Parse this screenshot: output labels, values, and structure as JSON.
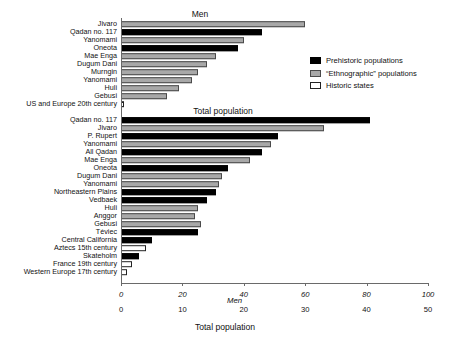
{
  "figure": {
    "width": 450,
    "height": 346,
    "axis_bottom_label": "Total population",
    "axis_men_label": "Men"
  },
  "legend": {
    "items": [
      {
        "key": "prehistoric",
        "label": "Prehistoric populations",
        "color": "#000000"
      },
      {
        "key": "ethnographic",
        "label": "“Ethnographic” populations",
        "color": "#a8a8a8"
      },
      {
        "key": "historic",
        "label": "Historic states",
        "color": "#ffffff"
      }
    ]
  },
  "chart_data": {
    "type": "bar",
    "orientation": "horizontal",
    "title": "",
    "panels": [
      {
        "name": "men",
        "title": "Men",
        "xlabel": "Men",
        "ylabel": "",
        "xlim": [
          0,
          100
        ],
        "xticks": [
          0,
          20,
          40,
          60,
          80,
          100
        ],
        "grid": false,
        "categories": [
          "Jivaro",
          "Qadan no. 117",
          "Yanomami",
          "Oneota",
          "Mae Enga",
          "Dugum Dani",
          "Murngin",
          "Yanomami",
          "Huli",
          "Gebusi",
          "US and Europe 20th century"
        ],
        "values": [
          60,
          46,
          40,
          38,
          31,
          28,
          25,
          23,
          19,
          15,
          1
        ],
        "groups": [
          "ethnographic",
          "prehistoric",
          "ethnographic",
          "prehistoric",
          "ethnographic",
          "ethnographic",
          "ethnographic",
          "ethnographic",
          "ethnographic",
          "ethnographic",
          "historic"
        ]
      },
      {
        "name": "total_population",
        "title": "Total population",
        "xlabel": "Total population",
        "ylabel": "",
        "xlim": [
          0,
          50
        ],
        "xticks": [
          0,
          10,
          20,
          30,
          40,
          50
        ],
        "grid": false,
        "categories": [
          "Qadan no. 117",
          "Jivaro",
          "P. Rupert",
          "Yanomami",
          "All Qadan",
          "Mae Enga",
          "Oneota",
          "Dugum Dani",
          "Yanomami",
          "Northeastern Plains",
          "Vedbaek",
          "Huli",
          "Anggor",
          "Gebusi",
          "Téviec",
          "Central California",
          "Aztecs 15th century",
          "Skateholm",
          "France 19th century",
          "Western Europe 17th century"
        ],
        "values": [
          40.5,
          33.0,
          25.5,
          24.5,
          23.0,
          21.0,
          17.5,
          16.5,
          16.0,
          15.5,
          14.0,
          12.5,
          12.0,
          13.0,
          12.5,
          5.0,
          4.0,
          3.0,
          1.8,
          0.9
        ],
        "groups": [
          "prehistoric",
          "ethnographic",
          "prehistoric",
          "ethnographic",
          "prehistoric",
          "ethnographic",
          "prehistoric",
          "ethnographic",
          "ethnographic",
          "prehistoric",
          "prehistoric",
          "ethnographic",
          "ethnographic",
          "ethnographic",
          "prehistoric",
          "prehistoric",
          "historic",
          "prehistoric",
          "historic",
          "historic"
        ]
      }
    ]
  }
}
